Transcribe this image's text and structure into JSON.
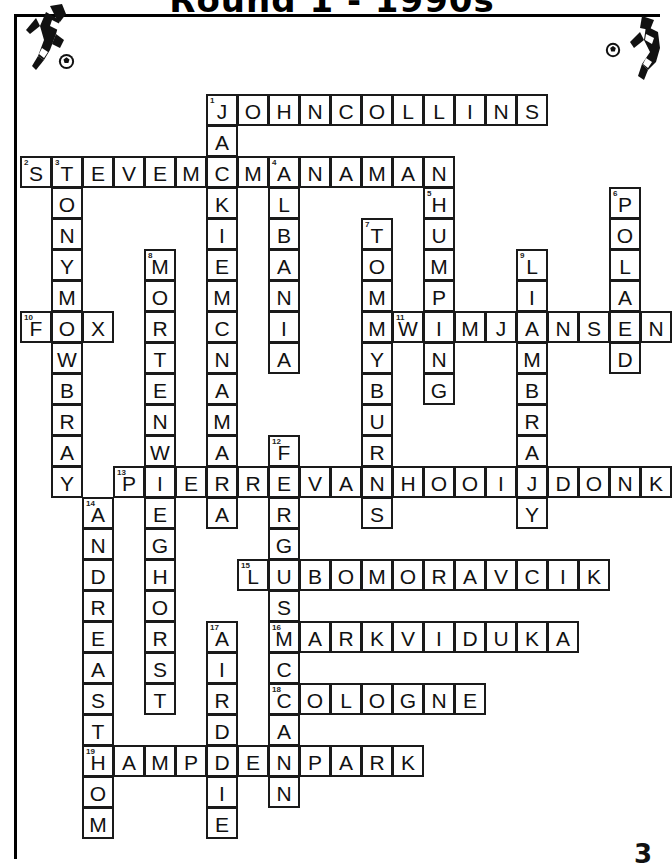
{
  "page": {
    "title": "Round 1 - 1990s",
    "page_number": "3",
    "background_color": "#ffffff",
    "ink_color": "#000000"
  },
  "decor": {
    "players": [
      "footballer-silhouette-left",
      "footballer-silhouette-right"
    ],
    "balls": [
      "soccer-ball-left",
      "soccer-ball-right"
    ],
    "rule": "header-rule"
  },
  "crossword": {
    "cell_size": 31,
    "origin_x": 20,
    "origin_y": 94,
    "entries": [
      {
        "number": "1",
        "direction": "across",
        "row": 0,
        "col": 6,
        "answer": "JOHNCOLLINS"
      },
      {
        "number": "1",
        "direction": "down",
        "row": 0,
        "col": 6,
        "answer": "JACKIEMCNAMARA"
      },
      {
        "number": "2",
        "direction": "across",
        "row": 2,
        "col": 0,
        "answer": "STEVEMCMANAMAN"
      },
      {
        "number": "3",
        "direction": "down",
        "row": 2,
        "col": 1,
        "answer": "TONYMOWBRAY"
      },
      {
        "number": "4",
        "direction": "down",
        "row": 2,
        "col": 8,
        "answer": "ALBANIA"
      },
      {
        "number": "5",
        "direction": "down",
        "row": 3,
        "col": 13,
        "answer": "HUMPING"
      },
      {
        "number": "6",
        "direction": "down",
        "row": 3,
        "col": 19,
        "answer": "POLAND"
      },
      {
        "number": "7",
        "direction": "down",
        "row": 4,
        "col": 11,
        "answer": "TOMMYBURNS"
      },
      {
        "number": "8",
        "direction": "down",
        "row": 5,
        "col": 4,
        "answer": "MORTENWIEGHORST"
      },
      {
        "number": "9",
        "direction": "down",
        "row": 5,
        "col": 16,
        "answer": "LIAMBRADY"
      },
      {
        "number": "10",
        "direction": "across",
        "row": 7,
        "col": 0,
        "answer": "FOX"
      },
      {
        "number": "11",
        "direction": "across",
        "row": 7,
        "col": 12,
        "answer": "WIMJANSEN"
      },
      {
        "number": "12",
        "direction": "down",
        "row": 11,
        "col": 8,
        "answer": "FERGUSMCCANN"
      },
      {
        "number": "13",
        "direction": "across",
        "row": 12,
        "col": 3,
        "answer": "PIERREVANHOOIJDONK"
      },
      {
        "number": "14",
        "direction": "down",
        "row": 13,
        "col": 2,
        "answer": "ANDREASTHOM"
      },
      {
        "number": "15",
        "direction": "across",
        "row": 15,
        "col": 7,
        "answer": "LUBOMORAVCIK"
      },
      {
        "number": "16",
        "direction": "across",
        "row": 17,
        "col": 8,
        "answer": "MARKVIDUKA"
      },
      {
        "number": "17",
        "direction": "down",
        "row": 17,
        "col": 6,
        "answer": "AIRDRIE"
      },
      {
        "number": "18",
        "direction": "across",
        "row": 19,
        "col": 8,
        "answer": "COLOGNE"
      },
      {
        "number": "19",
        "direction": "across",
        "row": 21,
        "col": 2,
        "answer": "HAMPDENPARK"
      }
    ]
  }
}
